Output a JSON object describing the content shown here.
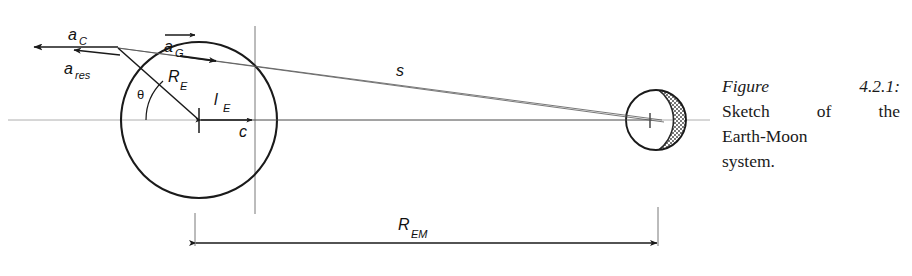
{
  "figure": {
    "caption": {
      "label": "Figure",
      "number": "4.2.1:",
      "line2_a": "Sketch",
      "line2_b": "of",
      "line2_c": "the",
      "line3": "Earth-Moon",
      "line4": "system."
    },
    "title_text": "Sketch of the Earth-Moon system.",
    "diagram": {
      "type": "physics-sketch",
      "subject": "Earth-Moon system gravitational and centrifugal acceleration",
      "labels": {
        "a_c": {
          "base": "a",
          "sub": "C",
          "meaning": "centrifugal-acceleration",
          "vector": false
        },
        "a_res": {
          "base": "a",
          "sub": "res",
          "meaning": "resultant-acceleration",
          "vector": false
        },
        "a_g": {
          "base": "a",
          "sub": "G",
          "meaning": "gravitational-acceleration",
          "vector": true
        },
        "R_E": {
          "base": "R",
          "sub": "E",
          "meaning": "earth-radius"
        },
        "l_E": {
          "base": "l",
          "sub": "E",
          "meaning": "barycenter-offset-from-earth-center"
        },
        "c": {
          "base": "c",
          "sub": "",
          "meaning": "barycenter"
        },
        "theta": {
          "base": "θ",
          "sub": "",
          "meaning": "polar-angle"
        },
        "s": {
          "base": "s",
          "sub": "",
          "meaning": "surface-point-to-moon-distance"
        },
        "R_EM": {
          "base": "R",
          "sub": "EM",
          "meaning": "earth-moon-distance"
        }
      },
      "bodies": {
        "earth": {
          "name": "Earth",
          "cx": 199,
          "cy": 120,
          "r": 78
        },
        "moon": {
          "name": "Moon",
          "cx": 656,
          "cy": 120,
          "r": 30,
          "shading": "crescent-right"
        }
      },
      "colors": {
        "ink": "#1a1a1a",
        "thin_ink": "#555555",
        "axis": "#9a9a9a",
        "shading": "#4a4a4a",
        "background": "#ffffff"
      }
    }
  }
}
